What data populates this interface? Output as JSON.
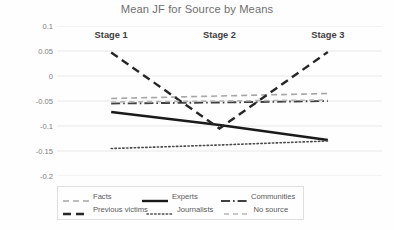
{
  "chart_data": {
    "type": "line",
    "title": "Mean JF for Source by Means",
    "xlabel": "",
    "ylabel": "",
    "categories": [
      "Stage 1",
      "Stage 2",
      "Stage 3"
    ],
    "ylim": [
      -0.2,
      0.1
    ],
    "yticks": [
      0.1,
      0.05,
      0,
      -0.05,
      -0.1,
      -0.15,
      -0.2
    ],
    "ytick_labels": [
      "0.1",
      "0.05",
      "0",
      "-0.05",
      "-0.1",
      "-0.15",
      "-0.2"
    ],
    "grid": true,
    "legend_position": "bottom",
    "series": [
      {
        "name": "Facts",
        "values": [
          -0.045,
          -0.04,
          -0.035
        ],
        "color": "#a6a6a6",
        "dash": "medium-dash",
        "width": 1.6
      },
      {
        "name": "Experts",
        "values": [
          -0.072,
          -0.098,
          -0.128
        ],
        "color": "#1a1a1a",
        "dash": "solid",
        "width": 2.4
      },
      {
        "name": "Communities",
        "values": [
          -0.055,
          -0.053,
          -0.05
        ],
        "color": "#404040",
        "dash": "dash-dot",
        "width": 1.9
      },
      {
        "name": "Previous victims",
        "values": [
          0.047,
          -0.105,
          0.048
        ],
        "color": "#262626",
        "dash": "long-dash",
        "width": 2.4
      },
      {
        "name": "Journalists",
        "values": [
          -0.145,
          -0.138,
          -0.13
        ],
        "color": "#4d4d4d",
        "dash": "dotted",
        "width": 1.6
      },
      {
        "name": "No source",
        "values": [
          -0.052,
          -0.05,
          -0.048
        ],
        "color": "#b5b5b5",
        "dash": "light-dash",
        "width": 1.6
      }
    ]
  },
  "legend": {
    "rows": [
      [
        "Facts",
        "Experts",
        "Communities"
      ],
      [
        "Previous victims",
        "Journalists",
        "No source"
      ]
    ]
  },
  "colors": {
    "background": "#fefefe",
    "grid": "#e8e8e8",
    "title_text": "#6f6f6f",
    "tick_text": "#7d7d7d",
    "category_text": "#404040",
    "legend_border": "#dedede"
  }
}
